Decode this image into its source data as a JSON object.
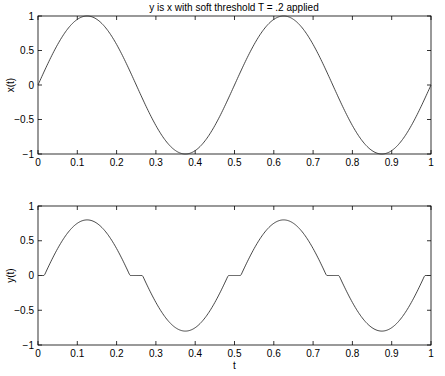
{
  "title": "y is x with soft threshold T = .2 applied",
  "chart_data": [
    {
      "type": "line",
      "title": "y is x with soft threshold T = .2 applied",
      "xlabel": "",
      "ylabel": "x(t)",
      "xlim": [
        0,
        1
      ],
      "ylim": [
        -1,
        1
      ],
      "xticks": [
        0,
        0.1,
        0.2,
        0.3,
        0.4,
        0.5,
        0.6,
        0.7,
        0.8,
        0.9,
        1
      ],
      "xtick_labels": [
        "0",
        "0.1",
        "0.2",
        "0.3",
        "0.4",
        "0.5",
        "0.6",
        "0.7",
        "0.8",
        "0.9",
        "1"
      ],
      "yticks": [
        -1,
        -0.5,
        0,
        0.5,
        1
      ],
      "ytick_labels": [
        "−1",
        "−0.5",
        "0",
        "0.5",
        "1"
      ],
      "grid": false,
      "series": [
        {
          "name": "x(t)",
          "formula": "sin(4*pi*t)",
          "x": [
            0,
            0.0625,
            0.125,
            0.1875,
            0.25,
            0.3125,
            0.375,
            0.4375,
            0.5,
            0.5625,
            0.625,
            0.6875,
            0.75,
            0.8125,
            0.875,
            0.9375,
            1
          ],
          "values": [
            0,
            0.707,
            1,
            0.707,
            0,
            -0.707,
            -1,
            -0.707,
            0,
            0.707,
            1,
            0.707,
            0,
            -0.707,
            -1,
            -0.707,
            0
          ]
        }
      ]
    },
    {
      "type": "line",
      "title": "",
      "xlabel": "t",
      "ylabel": "y(t)",
      "xlim": [
        0,
        1
      ],
      "ylim": [
        -1,
        1
      ],
      "xticks": [
        0,
        0.1,
        0.2,
        0.3,
        0.4,
        0.5,
        0.6,
        0.7,
        0.8,
        0.9,
        1
      ],
      "xtick_labels": [
        "0",
        "0.1",
        "0.2",
        "0.3",
        "0.4",
        "0.5",
        "0.6",
        "0.7",
        "0.8",
        "0.9",
        "1"
      ],
      "yticks": [
        -1,
        -0.5,
        0,
        0.5,
        1
      ],
      "ytick_labels": [
        "−1",
        "−0.5",
        "0",
        "0.5",
        "1"
      ],
      "grid": false,
      "series": [
        {
          "name": "y(t)",
          "formula": "sign(x)*max(|x|-0.2,0), x=sin(4*pi*t)",
          "threshold": 0.2,
          "x": [
            0,
            0.016,
            0.0625,
            0.125,
            0.1875,
            0.234,
            0.266,
            0.3125,
            0.375,
            0.4375,
            0.484,
            0.516,
            0.5625,
            0.625,
            0.6875,
            0.734,
            0.766,
            0.8125,
            0.875,
            0.9375,
            0.984,
            1
          ],
          "values": [
            0,
            0,
            0.507,
            0.8,
            0.507,
            0,
            0,
            -0.507,
            -0.8,
            -0.507,
            0,
            0,
            0.507,
            0.8,
            0.507,
            0,
            0,
            -0.507,
            -0.8,
            -0.507,
            0,
            0
          ]
        }
      ]
    }
  ]
}
